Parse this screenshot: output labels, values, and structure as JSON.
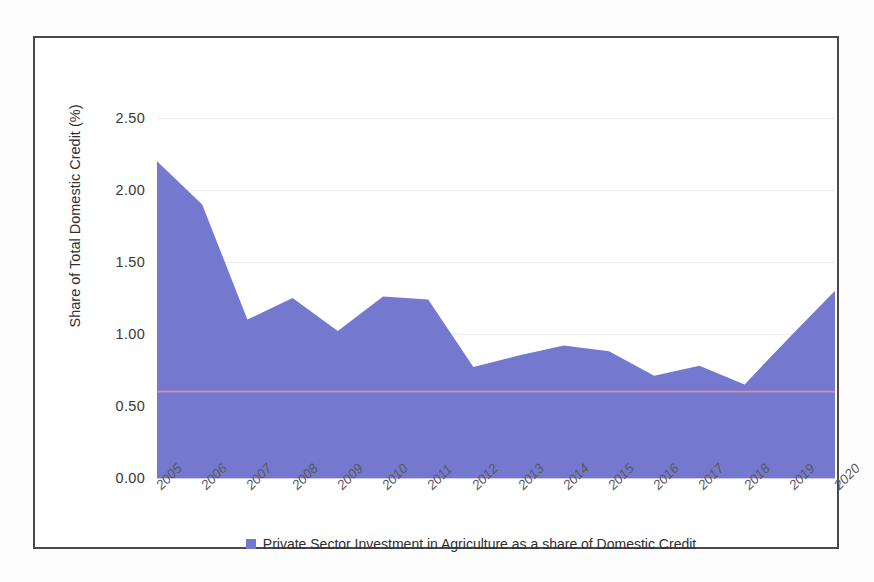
{
  "figure": {
    "frame_color": "#4a4a4c",
    "background": "#ffffff"
  },
  "chart_data": {
    "type": "area",
    "title": "",
    "subtitle": "",
    "xlabel": "",
    "ylabel": "Share of Total Domestic Credit (%)",
    "categories": [
      "2005",
      "2006",
      "2007",
      "2008",
      "2009",
      "2010",
      "2011",
      "2012",
      "2013",
      "2014",
      "2015",
      "2016",
      "2017",
      "2018",
      "2019",
      "2020"
    ],
    "series": [
      {
        "name": "Private Sector Investment in Agriculture as a share of Domestic Credit",
        "color": "#7479cf",
        "values": [
          2.2,
          1.9,
          1.1,
          1.25,
          1.02,
          1.26,
          1.24,
          0.77,
          0.85,
          0.92,
          0.88,
          0.71,
          0.78,
          0.65,
          0.98,
          1.3
        ]
      }
    ],
    "reference_line": {
      "name": "average-reference-line",
      "value": 0.6,
      "color": "#e08b9e"
    },
    "ylim": [
      0.0,
      2.5
    ],
    "yticks": [
      "0.00",
      "0.50",
      "1.00",
      "1.50",
      "2.00",
      "2.50"
    ],
    "ytick_values": [
      0.0,
      0.5,
      1.0,
      1.5,
      2.0,
      2.5
    ],
    "grid": true,
    "legend_position": "bottom"
  },
  "legend": {
    "swatch_color": "#7479cf",
    "label": "Private Sector Investment in Agriculture as a share of Domestic Credit"
  }
}
